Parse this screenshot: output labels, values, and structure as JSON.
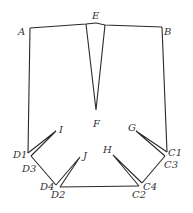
{
  "diagram": {
    "type": "pattern-draft",
    "stroke_color": "#2a2a2a",
    "labels": {
      "A": "A",
      "B": "B",
      "E": "E",
      "F": "F",
      "G": "G",
      "H": "H",
      "I": "I",
      "J": "J",
      "C1": "C1",
      "C2": "C2",
      "C3": "C3",
      "C4": "C4",
      "D1": "D1",
      "D2": "D2",
      "D3": "D3",
      "D4": "D4"
    },
    "points": {
      "A": [
        30,
        28
      ],
      "B": [
        162,
        27
      ],
      "E": [
        96,
        23
      ],
      "F": [
        96,
        110
      ],
      "G": [
        136,
        131
      ],
      "H": [
        113,
        155
      ],
      "I": [
        56,
        131
      ],
      "J": [
        80,
        157
      ],
      "C1": [
        167,
        152
      ],
      "C2": [
        139,
        186
      ],
      "C3": [
        165,
        156
      ],
      "C4": [
        142,
        183
      ],
      "D1": [
        28,
        153
      ],
      "D2": [
        60,
        187
      ],
      "D3": [
        31,
        156
      ],
      "D4": [
        56,
        185
      ]
    }
  }
}
